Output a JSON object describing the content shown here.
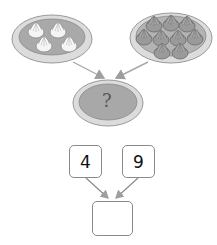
{
  "diagram": {
    "left_plate": {
      "item": "light dumpling",
      "count": 4
    },
    "right_plate": {
      "item": "dark dumpling",
      "count": 10
    },
    "result_plate": {
      "label": "?"
    },
    "number_bond": {
      "left_value": "4",
      "right_value": "9",
      "answer_value": ""
    },
    "colors": {
      "plate_rim": "#d7d7d7",
      "plate_inner": "#a8a8a8",
      "arrow": "#9e9e9e",
      "box_border": "#8a8a8a"
    }
  }
}
